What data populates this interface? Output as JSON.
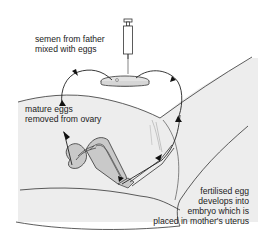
{
  "diagram": {
    "labels": {
      "semen": {
        "line1": "semen from father",
        "line2": "mixed with eggs"
      },
      "mature": {
        "line1": "mature eggs",
        "line2": "removed from ovary"
      },
      "fertilised": {
        "line1": "fertilised egg",
        "line2": "develops into",
        "line3": "embryo which is",
        "line4": "placed in mother's uterus"
      }
    },
    "colors": {
      "line": "#222222",
      "body_fill": "#ececec",
      "organ_fill": "#c8c8c8",
      "background": "#ffffff"
    }
  }
}
